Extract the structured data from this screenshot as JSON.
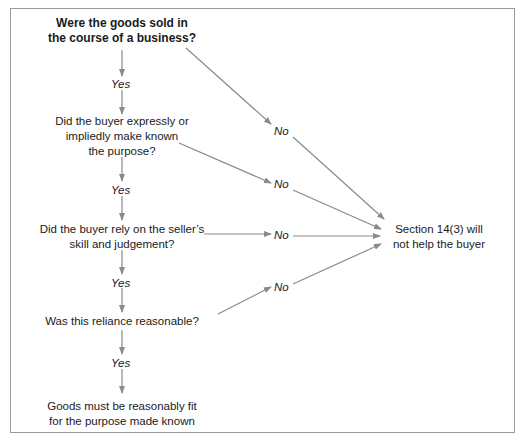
{
  "diagram": {
    "nodes": {
      "q1": "Were the goods sold in the course of a business?",
      "q1_line1": "Were the goods sold in",
      "q1_line2": "the course of a business?",
      "q2_line1": "Did the buyer expressly or",
      "q2_line2": "impliedly make known",
      "q2_line3": "the purpose?",
      "q3_line1": "Did the buyer rely on the seller’s",
      "q3_line2": "skill and judgement?",
      "q4": "Was this reliance reasonable?",
      "result_yes_line1": "Goods must be reasonably fit",
      "result_yes_line2": "for the purpose made known",
      "result_no_line1": "Section 14(3) will",
      "result_no_line2": "not help the buyer"
    },
    "labels": {
      "yes1": "Yes",
      "yes2": "Yes",
      "yes3": "Yes",
      "yes4": "Yes",
      "no1": "No",
      "no2": "No",
      "no3": "No",
      "no4": "No"
    },
    "colors": {
      "arrow": "#8a8a8a",
      "border": "#9a9a9a",
      "text": "#1a1a1a"
    }
  }
}
